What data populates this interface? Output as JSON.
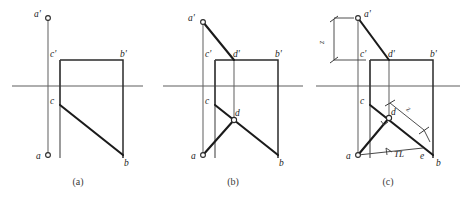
{
  "figure": {
    "panel_count": 3,
    "ground_line_label": "XY ground line"
  },
  "colors": {
    "background": "#ffffff",
    "ground_line": "#5f5f5f",
    "thin_line": "#666666",
    "heavy_line": "#1b1b1b",
    "rect_line": "#2b2b2b",
    "dimension": "#3a3a3a",
    "label_text": "#1b1b1b",
    "caption_text": "#3a3a3a"
  },
  "panels": [
    {
      "id": "a",
      "caption": "(a)",
      "labels": {
        "a_front": "a'",
        "c_front": "c'",
        "b_front": "b'",
        "c_top": "c",
        "a_top": "a",
        "b_top": "b"
      }
    },
    {
      "id": "b",
      "caption": "(b)",
      "labels": {
        "a_front": "a'",
        "c_front": "c'",
        "d_front": "d'",
        "b_front": "b'",
        "c_top": "c",
        "d_top": "d",
        "a_top": "a",
        "b_top": "b"
      }
    },
    {
      "id": "c",
      "caption": "(c)",
      "labels": {
        "a_front": "a'",
        "c_front": "c'",
        "d_front": "d'",
        "b_front": "b'",
        "c_top": "c",
        "d_top": "d",
        "a_top": "a",
        "e_top": "e",
        "b_top": "b"
      },
      "dimensions": {
        "z_front": "z",
        "z_top": "z",
        "true_length": "TL"
      }
    }
  ]
}
